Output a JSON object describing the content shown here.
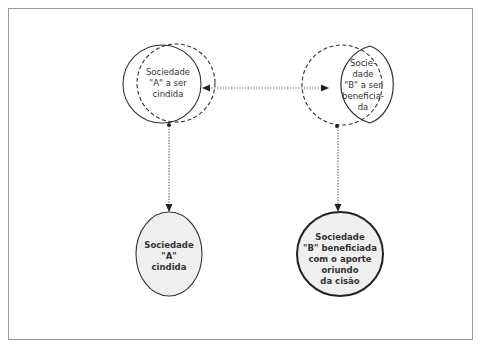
{
  "diagram": {
    "type": "company-split-flow",
    "top_left": {
      "label_lines": [
        "Sociedade",
        "\"A\" a ser",
        "cindida"
      ]
    },
    "top_right": {
      "label_lines": [
        "Socie-",
        "dade",
        "\"B\" a ser",
        "beneficia-",
        "da"
      ]
    },
    "bottom_left": {
      "label_lines": [
        "Sociedade",
        "\"A\"",
        "cindida"
      ]
    },
    "bottom_right": {
      "label_lines": [
        "Sociedade",
        "\"B\" beneficiada",
        "com o aporte",
        "oriundo",
        "da cisão"
      ]
    },
    "connectors": [
      {
        "from": "top_left",
        "to": "top_right",
        "style": "dotted",
        "direction": "bidirectional"
      },
      {
        "from": "top_left",
        "to": "bottom_left",
        "style": "dotted",
        "direction": "down"
      },
      {
        "from": "top_right",
        "to": "bottom_right",
        "style": "dotted",
        "direction": "down"
      }
    ],
    "colors": {
      "stroke": "#333333",
      "fill_result": "#efefef",
      "frame": "#9a9a9a"
    }
  }
}
